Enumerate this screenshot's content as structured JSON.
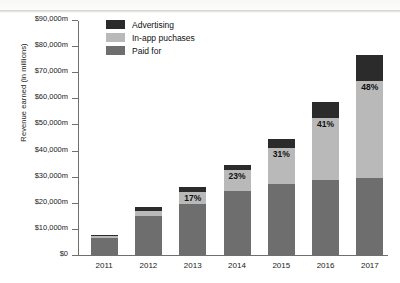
{
  "chart_data": {
    "type": "bar",
    "subtype": "stacked-bar",
    "title": "",
    "xlabel": "",
    "ylabel": "Revenue earned (in millions)",
    "categories": [
      "2011",
      "2012",
      "2013",
      "2014",
      "2015",
      "2016",
      "2017"
    ],
    "ylim": [
      0,
      90000
    ],
    "ytick_step": 10000,
    "ytick_labels": [
      "$0",
      "$10,000m",
      "$20,000m",
      "$30,000m",
      "$40,000m",
      "$50,000m",
      "$60,000m",
      "$70,000m",
      "$80,000m",
      "$90,000m"
    ],
    "ytick_values": [
      0,
      10000,
      20000,
      30000,
      40000,
      50000,
      60000,
      70000,
      80000,
      90000
    ],
    "grid": false,
    "legend_position": "top-left-inside",
    "stack_order": [
      "Paid for",
      "In-app puchases",
      "Advertising"
    ],
    "series": [
      {
        "name": "Paid for",
        "color": "#6e6e6e",
        "values": [
          7000,
          15500,
          20000,
          25000,
          27500,
          29000,
          30000
        ]
      },
      {
        "name": "In-app puchases",
        "color": "#b9b9b9",
        "values": [
          500,
          1800,
          4500,
          8000,
          14000,
          24000,
          37000
        ]
      },
      {
        "name": "Advertising",
        "color": "#2b2b2b",
        "values": [
          500,
          1500,
          2000,
          2000,
          3500,
          6000,
          10000
        ]
      }
    ],
    "totals": [
      8000,
      18800,
      26500,
      35000,
      45000,
      59000,
      77000
    ],
    "annotations": [
      {
        "category": "2013",
        "series": "In-app puchases",
        "label": "17%"
      },
      {
        "category": "2014",
        "series": "In-app puchases",
        "label": "23%"
      },
      {
        "category": "2015",
        "series": "In-app puchases",
        "label": "31%"
      },
      {
        "category": "2016",
        "series": "In-app puchases",
        "label": "41%"
      },
      {
        "category": "2017",
        "series": "In-app puchases",
        "label": "48%"
      }
    ]
  },
  "legend": {
    "items": [
      {
        "label": "Advertising",
        "color": "#2b2b2b"
      },
      {
        "label": "In-app puchases",
        "color": "#b9b9b9"
      },
      {
        "label": "Paid for",
        "color": "#6e6e6e"
      }
    ]
  }
}
